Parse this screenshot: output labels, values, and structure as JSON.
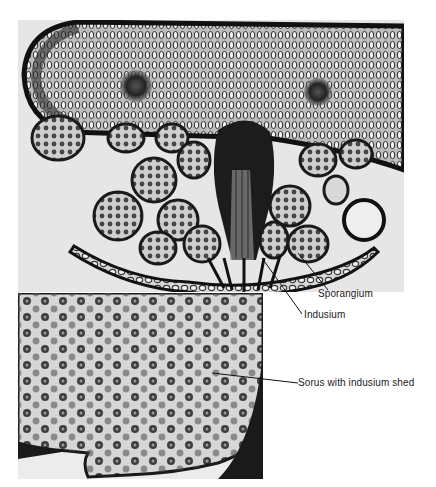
{
  "figure": {
    "panels": [
      {
        "id": "top",
        "description": "cross-section micrograph of fern leaf with sorus, sporangia and indusium"
      },
      {
        "id": "bottom",
        "description": "surface view of fern leaf underside with dotted sori"
      }
    ],
    "labels": {
      "sporangium": "Sporangium",
      "indusium": "Indusium",
      "sorus": "Sorus with indusium shed"
    },
    "colors": {
      "background": "#ffffff",
      "panel_top_bg": "#e6e6e6",
      "tissue_dark": "#1c1c1c",
      "label_text": "#222222"
    }
  }
}
